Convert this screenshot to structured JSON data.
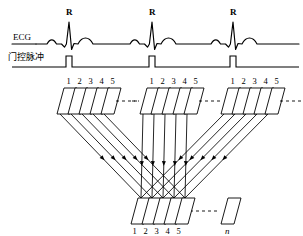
{
  "figure": {
    "kind": "cardiac-gated-acquisition-diagram",
    "width": 303,
    "height": 236,
    "stroke_color": "#000000",
    "background": "#ffffff"
  },
  "signals": {
    "ecg": {
      "label": "ECG",
      "peak_label": "R",
      "beats": 3,
      "peak_labels": [
        "R",
        "R",
        "R"
      ]
    },
    "gate": {
      "label": "门控脉冲",
      "pulses": 3
    }
  },
  "acquisition": {
    "frames_per_cycle": 5,
    "frame_numbers": [
      "1",
      "2",
      "3",
      "4",
      "5"
    ],
    "cycles": 3,
    "continuation": "…",
    "final_frame_label": "n"
  },
  "rows": {
    "top": {
      "groups": [
        {
          "numbers": [
            "1",
            "2",
            "3",
            "4",
            "5"
          ]
        },
        {
          "numbers": [
            "1",
            "2",
            "3",
            "4",
            "5"
          ]
        },
        {
          "numbers": [
            "1",
            "2",
            "3",
            "4",
            "5"
          ]
        }
      ]
    },
    "bottom": {
      "numbers": [
        "1",
        "2",
        "3",
        "4",
        "5"
      ],
      "extra_label": "n"
    }
  }
}
